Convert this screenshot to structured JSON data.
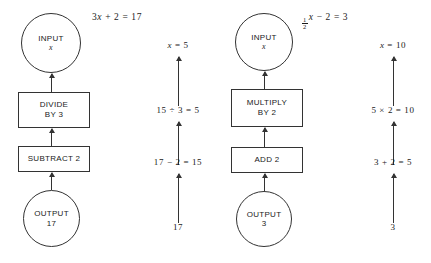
{
  "page": {
    "background": "#ffffff",
    "ink": "#333333",
    "text_color": "#1a1a1a"
  },
  "panels": [
    {
      "id": "left",
      "equation": {
        "prefix": "3",
        "variable": "x",
        "rest": " + 2  =  17",
        "full": "3x + 2 = 17"
      },
      "flow": {
        "input": {
          "label": "INPUT",
          "value": "x"
        },
        "steps": [
          {
            "line1": "DIVIDE",
            "line2": "BY 3"
          },
          {
            "line1": "SUBTRACT 2",
            "line2": ""
          }
        ],
        "output": {
          "label": "OUTPUT",
          "value": "17"
        }
      },
      "working": {
        "top": {
          "variable": "x",
          "rest": " = 5",
          "full": "x = 5"
        },
        "middle": "15 ÷ 3 = 5",
        "lower": "17 − 2 = 15",
        "start": "17"
      }
    },
    {
      "id": "right",
      "equation": {
        "fraction": {
          "numerator": "1",
          "denominator": "2"
        },
        "variable": "x",
        "rest": " − 2  =  3",
        "full": "1/2 x - 2 = 3"
      },
      "flow": {
        "input": {
          "label": "INPUT",
          "value": "x"
        },
        "steps": [
          {
            "line1": "MULTIPLY",
            "line2": "BY 2"
          },
          {
            "line1": "ADD 2",
            "line2": ""
          }
        ],
        "output": {
          "label": "OUTPUT",
          "value": "3"
        }
      },
      "working": {
        "top": {
          "variable": "x",
          "rest": " = 10",
          "full": "x = 10"
        },
        "middle": "5 × 2 = 10",
        "lower": "3 + 2 = 5",
        "start": "3"
      }
    }
  ]
}
